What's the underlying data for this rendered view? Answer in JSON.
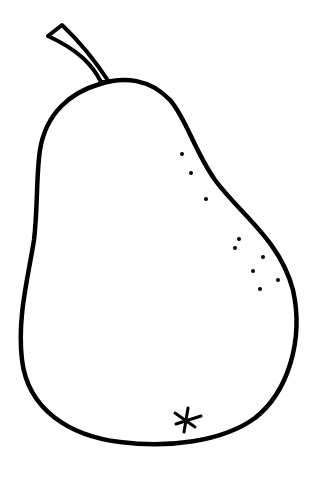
{
  "image": {
    "subject": "pear line drawing",
    "width": 324,
    "height": 481,
    "background": "#ffffff",
    "stroke_color": "#000000",
    "elements": {
      "stem": "stem",
      "body": "pear-body-outline",
      "speckles_count": 10,
      "blossom_mark": "*"
    }
  }
}
